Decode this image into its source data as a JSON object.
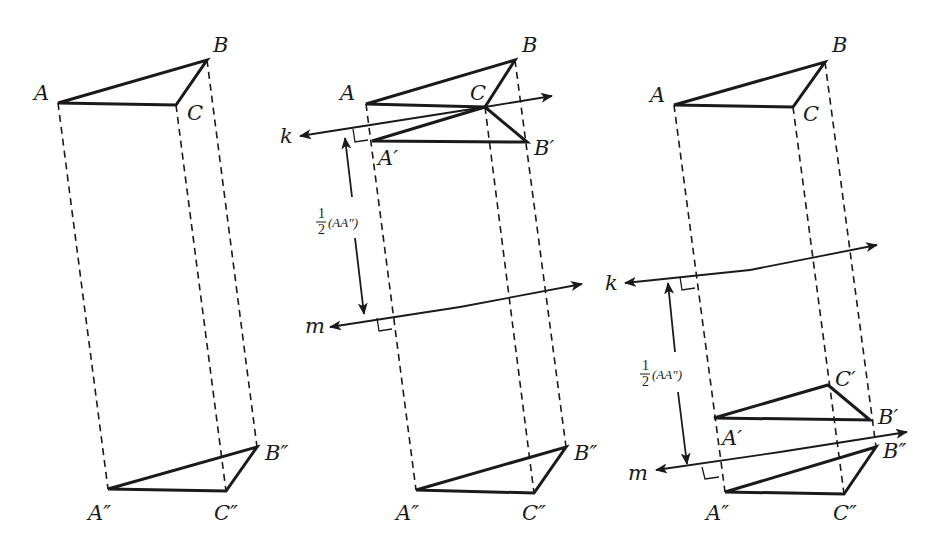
{
  "figure": {
    "panels": [
      {
        "id": "panel-1",
        "title": "Original and translated triangle",
        "labels": {
          "A": "A",
          "B": "B",
          "C": "C",
          "A2": "A″",
          "B2": "B″",
          "C2": "C″"
        },
        "points": {
          "A": [
            58,
            103
          ],
          "B": [
            207,
            60
          ],
          "C": [
            176,
            105
          ],
          "A2": [
            108,
            489
          ],
          "B2": [
            257,
            447
          ],
          "C2": [
            226,
            491
          ]
        }
      },
      {
        "id": "panel-2",
        "title": "Line k through C, line m halfway",
        "labels": {
          "A": "A",
          "B": "B",
          "C": "C",
          "A1": "A′",
          "B1": "B′",
          "A2": "A″",
          "B2": "B″",
          "C2": "C″",
          "k": "k",
          "m": "m"
        },
        "distance_label": {
          "num": "1",
          "den": "2",
          "expr": "(AA″)"
        },
        "points": {
          "A": [
            366,
            104
          ],
          "B": [
            515,
            60
          ],
          "C": [
            485,
            107
          ],
          "A1": [
            372,
            141
          ],
          "B1": [
            527,
            142
          ],
          "A2": [
            416,
            490
          ],
          "B2": [
            566,
            447
          ],
          "C2": [
            534,
            493
          ]
        }
      },
      {
        "id": "panel-3",
        "title": "Line k between, line m near image",
        "labels": {
          "A": "A",
          "B": "B",
          "C": "C",
          "A1": "A′",
          "B1": "B′",
          "C1": "C′",
          "A2": "A″",
          "B2": "B″",
          "C2": "C″",
          "k": "k",
          "m": "m"
        },
        "distance_label": {
          "num": "1",
          "den": "2",
          "expr": "(AA″)"
        },
        "points": {
          "A": [
            674,
            105
          ],
          "B": [
            825,
            62
          ],
          "C": [
            793,
            107
          ],
          "A1": [
            714,
            418
          ],
          "B1": [
            870,
            420
          ],
          "C1": [
            828,
            385
          ],
          "A2": [
            725,
            492
          ],
          "B2": [
            876,
            447
          ],
          "C2": [
            844,
            494
          ]
        }
      }
    ],
    "colors": {
      "ink": "#1a1a1a",
      "background": "#ffffff"
    }
  }
}
